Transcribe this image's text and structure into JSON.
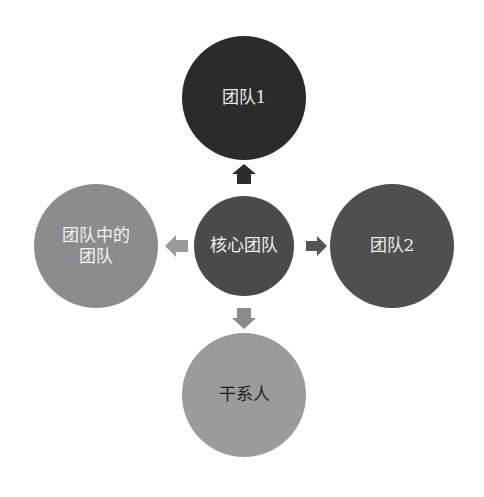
{
  "diagram": {
    "nodes": {
      "top": {
        "label": "团队1"
      },
      "center": {
        "label": "核心团队"
      },
      "left": {
        "label_line1": "团队中的",
        "label_line2": "团队"
      },
      "right": {
        "label": "团队2"
      },
      "bottom": {
        "label": "干系人"
      }
    },
    "arrows": [
      {
        "from": "核心团队",
        "to": "团队1",
        "direction": "up",
        "color": "#2b2b2b"
      },
      {
        "from": "核心团队",
        "to": "团队2",
        "direction": "right",
        "color": "#555555"
      },
      {
        "from": "核心团队",
        "to": "团队中的团队",
        "direction": "left",
        "color": "#9a9a9a"
      },
      {
        "from": "核心团队",
        "to": "干系人",
        "direction": "down",
        "color": "#8a8a8a"
      }
    ],
    "colors": {
      "top": "#2b2b2b",
      "center": "#4a4a4a",
      "left": "#8c8c8c",
      "right": "#4f4f4f",
      "bottom": "#9b9b9b"
    }
  }
}
